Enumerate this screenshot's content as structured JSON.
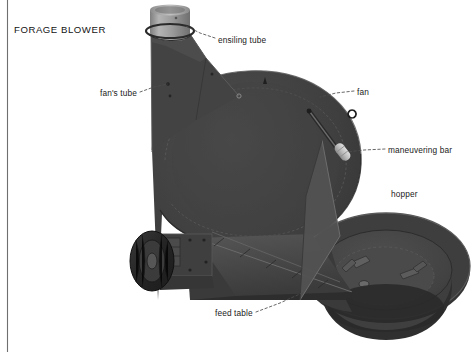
{
  "document": {
    "title": "FORAGE BLOWER",
    "kind": "technical-illustration",
    "page_rule": "vertical-margin-rule-left"
  },
  "colors": {
    "background": "#ffffff",
    "body_dark": "#3d3d3d",
    "body_mid": "#4a4a4a",
    "body_shadow": "#2c2c2c",
    "body_light_panel": "#565656",
    "ensiling_tube": "#9a9a9a",
    "ensiling_tube_shade": "#7d7d7d",
    "hopper_rim": "#3a3a3a",
    "hopper_inner": "#474747",
    "hopper_floor": "#505050",
    "tire": "#2b2b2b",
    "handle_light": "#c9c9c9",
    "label_text": "#1a1a1a",
    "leader_line": "#4d4d4d",
    "margin_rule": "#6f6f6f"
  },
  "labels": [
    {
      "id": "ensiling-tube",
      "text": "ensiling tube",
      "x": 218,
      "y": 36,
      "leader_to_x": 186,
      "leader_to_y": 26
    },
    {
      "id": "fan",
      "text": "fan",
      "x": 357,
      "y": 88,
      "leader_to_x": 318,
      "leader_to_y": 97
    },
    {
      "id": "maneuvering-bar",
      "text": "maneuvering bar",
      "x": 388,
      "y": 146,
      "leader_to_x": 345,
      "leader_to_y": 152
    },
    {
      "id": "hopper",
      "text": "hopper",
      "x": 391,
      "y": 190,
      "leader_to_x": null,
      "leader_to_y": null
    },
    {
      "id": "fans-tube",
      "text": "fan's tube",
      "x": 100,
      "y": 89,
      "leader_to_x": 168,
      "leader_to_y": 84
    },
    {
      "id": "feed-table",
      "text": "feed table",
      "x": 215,
      "y": 309,
      "leader_to_x": 300,
      "leader_to_y": 292
    }
  ],
  "parts": [
    {
      "id": "ensiling-tube",
      "name": "ensiling tube",
      "description": "light gray cylindrical discharge pipe at top of machine"
    },
    {
      "id": "fans-tube",
      "name": "fan's tube",
      "description": "tapered dark duct rising from fan housing to the ensiling tube"
    },
    {
      "id": "fan",
      "name": "fan",
      "description": "large round fan housing forming the body of the blower"
    },
    {
      "id": "maneuvering-bar",
      "name": "maneuvering bar",
      "description": "diagonal rod with light handle mounted on the fan housing"
    },
    {
      "id": "hopper",
      "name": "hopper",
      "description": "large circular bowl at right that receives forage"
    },
    {
      "id": "feed-table",
      "name": "feed table",
      "description": "inclined chute / table running from the hopper to the fan inlet"
    },
    {
      "id": "wheel",
      "name": "wheel",
      "description": "transport tire on the left side of the chassis"
    },
    {
      "id": "chassis",
      "name": "chassis",
      "description": "lower frame beam carrying the wheel and the feed table"
    }
  ]
}
